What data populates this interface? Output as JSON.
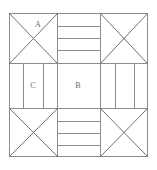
{
  "diagram": {
    "type": "nine-patch-quilt-block",
    "frame": {
      "x": 9,
      "y": 13,
      "width": 139,
      "height": 144,
      "stroke_color": "#8c8c8c",
      "stroke_width": 1
    },
    "grid": {
      "columns": 3,
      "rows": 3,
      "col_edges": [
        9,
        57,
        100,
        148
      ],
      "row_edges": [
        13,
        63,
        108,
        157
      ],
      "line_color": "#8c8c8c"
    },
    "cells": [
      {
        "position": "top-left",
        "pattern": "hourglass-x",
        "label": "A",
        "label_x": 38,
        "label_y": 25,
        "diagonals": 2
      },
      {
        "position": "top-center",
        "pattern": "horizontal-bars",
        "label": "",
        "bar_count": 4,
        "divider_count": 3
      },
      {
        "position": "top-right",
        "pattern": "hourglass-x",
        "label": "",
        "diagonals": 2
      },
      {
        "position": "middle-left",
        "pattern": "vertical-bars",
        "label": "C",
        "label_x": 33,
        "label_y": 85,
        "bar_count": 3,
        "divider_count": 2
      },
      {
        "position": "middle-center",
        "pattern": "plain",
        "label": "B",
        "label_x": 78,
        "label_y": 85
      },
      {
        "position": "middle-right",
        "pattern": "vertical-bars",
        "label": "",
        "bar_count": 3,
        "divider_count": 2
      },
      {
        "position": "bottom-left",
        "pattern": "hourglass-x",
        "label": "",
        "diagonals": 2
      },
      {
        "position": "bottom-center",
        "pattern": "horizontal-bars",
        "label": "",
        "bar_count": 4,
        "divider_count": 3
      },
      {
        "position": "bottom-right",
        "pattern": "hourglass-x",
        "label": "",
        "diagonals": 2
      }
    ],
    "labels": {
      "a": "A",
      "b": "B",
      "c": "C"
    },
    "colors": {
      "background": "#ffffff",
      "line": "#8c8c8c",
      "diagonal": "#707070",
      "label_text": "#6a6a6a"
    }
  }
}
